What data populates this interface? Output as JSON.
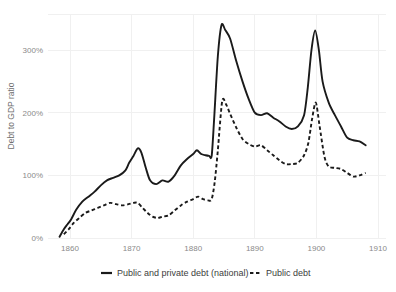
{
  "chart_data": {
    "type": "line",
    "title": "",
    "xlabel": "",
    "ylabel": "Debt to GDP ratio",
    "xlim": [
      1858,
      1910
    ],
    "ylim": [
      0,
      380
    ],
    "xticks": [
      "1860",
      "1870",
      "1880",
      "1890",
      "1900",
      "1910"
    ],
    "xtick_values": [
      1860,
      1870,
      1880,
      1890,
      1900,
      1910
    ],
    "yticks": [
      "0%",
      "100%",
      "200%",
      "300%"
    ],
    "ytick_values": [
      0,
      100,
      200,
      300
    ],
    "grid": true,
    "legend_position": "bottom",
    "series": [
      {
        "name": "Public and private debt (national)",
        "style": "solid",
        "color": "#1a1a1a",
        "x": [
          1858.3,
          1859,
          1859.6,
          1860.2,
          1861,
          1862,
          1863,
          1864,
          1865,
          1866,
          1867,
          1868,
          1869,
          1869.6,
          1870.3,
          1871,
          1871.6,
          1872.3,
          1873,
          1874,
          1875,
          1876,
          1877,
          1878,
          1879,
          1880,
          1880.6,
          1881.3,
          1882,
          1882.6,
          1883,
          1883.4,
          1884,
          1884.6,
          1885.2,
          1886,
          1887,
          1888,
          1889,
          1890,
          1891,
          1892,
          1893,
          1894,
          1895,
          1896,
          1897,
          1898,
          1898.6,
          1899.2,
          1899.8,
          1900.4,
          1901,
          1902,
          1903,
          1904,
          1905,
          1906,
          1907,
          1908
        ],
        "y": [
          2,
          14,
          22,
          30,
          45,
          58,
          66,
          74,
          84,
          92,
          96,
          100,
          108,
          120,
          131,
          143,
          136,
          112,
          92,
          86,
          92,
          90,
          100,
          116,
          126,
          134,
          140,
          134,
          132,
          131,
          131,
          190,
          290,
          340,
          332,
          318,
          282,
          250,
          222,
          200,
          196,
          199,
          192,
          186,
          178,
          174,
          178,
          196,
          240,
          300,
          331,
          300,
          250,
          216,
          196,
          178,
          160,
          156,
          154,
          148
        ]
      },
      {
        "name": "Public debt",
        "style": "dashed",
        "color": "#1a1a1a",
        "x": [
          1859,
          1859.8,
          1860.6,
          1861.5,
          1862.5,
          1863.5,
          1864.5,
          1865.5,
          1866.5,
          1867.5,
          1868.5,
          1869.5,
          1870.3,
          1871,
          1871.8,
          1872.6,
          1873.4,
          1874.2,
          1875,
          1876,
          1877,
          1878,
          1879,
          1880,
          1880.8,
          1881.6,
          1882.4,
          1883,
          1883.5,
          1884,
          1884.7,
          1885.3,
          1886,
          1887,
          1888,
          1889,
          1890,
          1891,
          1892,
          1893,
          1894,
          1895,
          1896,
          1897,
          1898,
          1898.7,
          1899.3,
          1899.9,
          1900.5,
          1901.3,
          1902,
          1903,
          1904,
          1905,
          1906,
          1907,
          1908
        ],
        "y": [
          6,
          14,
          24,
          32,
          40,
          44,
          48,
          52,
          56,
          54,
          52,
          54,
          56,
          56,
          48,
          40,
          34,
          32,
          34,
          36,
          44,
          52,
          58,
          62,
          66,
          62,
          60,
          62,
          90,
          140,
          218,
          214,
          198,
          176,
          158,
          150,
          146,
          148,
          140,
          132,
          124,
          118,
          118,
          120,
          132,
          152,
          190,
          216,
          180,
          130,
          114,
          112,
          110,
          104,
          98,
          100,
          104
        ]
      }
    ]
  },
  "legend": {
    "items": [
      {
        "label": "Public and private debt (national)",
        "style": "solid"
      },
      {
        "label": "Public debt",
        "style": "dashed"
      }
    ]
  },
  "axis": {
    "y_title": "Debt to GDP ratio"
  }
}
